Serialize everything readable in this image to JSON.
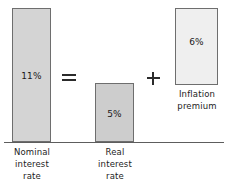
{
  "chart_data": {
    "type": "bar",
    "title": "",
    "subtitle": "",
    "xlabel": "",
    "ylabel": "",
    "grid": false,
    "legend": "none",
    "ylim": [
      0,
      11
    ],
    "categories": [
      "Nominal interest rate",
      "Real interest rate",
      "Inflation premium"
    ],
    "values": [
      11,
      5,
      6
    ],
    "value_labels": [
      "11%",
      "5%",
      "6%"
    ],
    "equation": "Nominal interest rate = Real interest rate + Inflation premium",
    "annotations": [
      "=",
      "+"
    ]
  },
  "bars": {
    "nominal": {
      "value_label": "11%",
      "name_line1": "Nominal",
      "name_line2": "interest",
      "name_line3": "rate",
      "fill": "#d4d4d4",
      "stroke": "#6e6e6e"
    },
    "real": {
      "value_label": "5%",
      "name_line1": "Real",
      "name_line2": "interest",
      "name_line3": "rate",
      "fill": "#cdcdcd",
      "stroke": "#6e6e6e"
    },
    "inflation": {
      "value_label": "6%",
      "name_line1": "Inflation",
      "name_line2": "premium",
      "fill": "#efefef",
      "stroke": "#6e6e6e"
    }
  },
  "operators": {
    "equals": "=",
    "plus": "+"
  },
  "colors": {
    "background": "#ffffff",
    "axis": "#5d5d5d",
    "text": "#1d1d1d"
  }
}
